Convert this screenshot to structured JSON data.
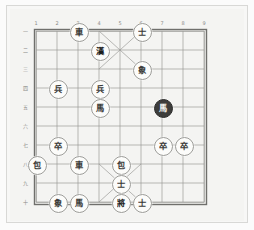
{
  "app": {
    "title": "Xiangqi Board Diagram",
    "background_color": "#f4f4f2",
    "line_color": "#8a8a87",
    "piece_fill": "#fcfcfa",
    "piece_ink": "#3a3a38",
    "dark_piece_fill": "#3d3d3b"
  },
  "board": {
    "file_labels": [
      "1",
      "2",
      "3",
      "4",
      "5",
      "6",
      "7",
      "8",
      "9"
    ],
    "rank_labels": [
      "一",
      "二",
      "三",
      "四",
      "五",
      "六",
      "七",
      "八",
      "九",
      "十"
    ],
    "files": 9,
    "ranks": 10,
    "palace_top": {
      "files": [
        4,
        6
      ],
      "ranks": [
        1,
        3
      ]
    },
    "palace_bottom": {
      "files": [
        4,
        6
      ],
      "ranks": [
        8,
        10
      ]
    }
  },
  "pieces": [
    {
      "id": "p1",
      "label": "車",
      "name": "chariot-black-file3-rank1",
      "file": 3,
      "rank": 1,
      "style": "light"
    },
    {
      "id": "p2",
      "label": "士",
      "name": "advisor-file6-rank1",
      "file": 6,
      "rank": 1,
      "style": "light"
    },
    {
      "id": "p3",
      "label": "漢",
      "name": "han-marker-file4-rank2",
      "file": 4,
      "rank": 2,
      "style": "bold"
    },
    {
      "id": "p4",
      "label": "象",
      "name": "elephant-file6-rank3",
      "file": 6,
      "rank": 3,
      "style": "light"
    },
    {
      "id": "p5",
      "label": "兵",
      "name": "soldier-file2-rank4",
      "file": 2,
      "rank": 4,
      "style": "light"
    },
    {
      "id": "p6",
      "label": "兵",
      "name": "soldier-file4-rank4",
      "file": 4,
      "rank": 4,
      "style": "light"
    },
    {
      "id": "p7",
      "label": "馬",
      "name": "horse-file4-rank5",
      "file": 4,
      "rank": 5,
      "style": "light"
    },
    {
      "id": "p8",
      "label": "馬",
      "name": "horse-dark-file7-rank5",
      "file": 7,
      "rank": 5,
      "style": "dark"
    },
    {
      "id": "p9",
      "label": "卒",
      "name": "pawn-file2-rank7",
      "file": 2,
      "rank": 7,
      "style": "light"
    },
    {
      "id": "p10",
      "label": "卒",
      "name": "pawn-file7-rank7",
      "file": 7,
      "rank": 7,
      "style": "light"
    },
    {
      "id": "p11",
      "label": "卒",
      "name": "pawn-file8-rank7",
      "file": 8,
      "rank": 7,
      "style": "light"
    },
    {
      "id": "p12",
      "label": "包",
      "name": "cannon-file1-rank8",
      "file": 1,
      "rank": 8,
      "style": "light"
    },
    {
      "id": "p13",
      "label": "車",
      "name": "chariot-file3-rank8",
      "file": 3,
      "rank": 8,
      "style": "light"
    },
    {
      "id": "p14",
      "label": "包",
      "name": "cannon-file5-rank8",
      "file": 5,
      "rank": 8,
      "style": "light"
    },
    {
      "id": "p15",
      "label": "士",
      "name": "advisor-file5-rank9",
      "file": 5,
      "rank": 9,
      "style": "light"
    },
    {
      "id": "p16",
      "label": "象",
      "name": "elephant-file2-rank10",
      "file": 2,
      "rank": 10,
      "style": "light"
    },
    {
      "id": "p17",
      "label": "馬",
      "name": "horse-file3-rank10",
      "file": 3,
      "rank": 10,
      "style": "light"
    },
    {
      "id": "p18",
      "label": "將",
      "name": "general-file5-rank10",
      "file": 5,
      "rank": 10,
      "style": "bold"
    },
    {
      "id": "p19",
      "label": "士",
      "name": "advisor-file6-rank10",
      "file": 6,
      "rank": 10,
      "style": "light"
    }
  ]
}
